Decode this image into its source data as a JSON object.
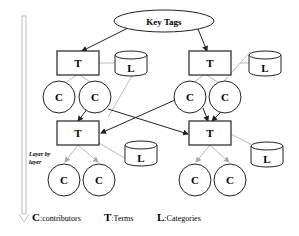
{
  "diagram": {
    "root": {
      "label": "Key Tags"
    },
    "nodes": {
      "term": "T",
      "contributor": "C",
      "category": "L"
    },
    "side_label": {
      "line1": "Layer by",
      "line2": "layer"
    },
    "legend": [
      {
        "key": "C",
        "text": ":contributors"
      },
      {
        "key": "T",
        "text": ":Terms"
      },
      {
        "key": "L",
        "text": ":Categories"
      }
    ],
    "colors": {
      "stroke": "#222222",
      "gray_link": "#bbbbbb",
      "arrow_shaft": "#cccccc"
    }
  }
}
